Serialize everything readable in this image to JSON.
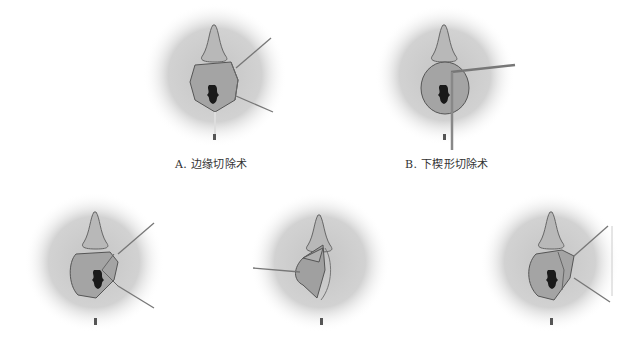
{
  "figure": {
    "panels": [
      {
        "id": "A",
        "caption": "A. 边缘切除术",
        "cx": 213,
        "cy": 72,
        "variant": "edge"
      },
      {
        "id": "B",
        "caption": "B. 下楔形切除术",
        "cx": 445,
        "cy": 72,
        "variant": "wedge-lower"
      },
      {
        "id": "C",
        "caption": "",
        "cx": 92,
        "cy": 260,
        "variant": "edge-2"
      },
      {
        "id": "D",
        "caption": "",
        "cx": 320,
        "cy": 262,
        "variant": "flap"
      },
      {
        "id": "E",
        "caption": "",
        "cx": 551,
        "cy": 260,
        "variant": "wedge-side"
      }
    ],
    "colors": {
      "halo": "#bdbdbd",
      "tissue": "#a8a8a8",
      "outline": "#555555",
      "dark": "#1a1a1a",
      "instrument": "#777777"
    }
  }
}
